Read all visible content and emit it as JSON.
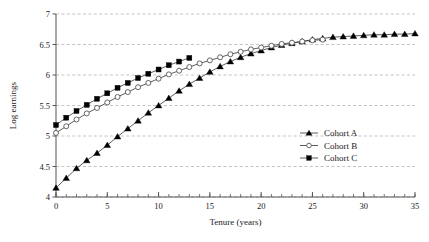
{
  "chart_data": {
    "type": "line",
    "title": "",
    "xlabel": "Tenure (years)",
    "ylabel": "Log earnings",
    "xlim": [
      0,
      35
    ],
    "ylim": [
      4,
      7
    ],
    "xticks": [
      0,
      5,
      10,
      15,
      20,
      25,
      30,
      35
    ],
    "yticks": [
      4,
      4.5,
      5,
      5.5,
      6,
      6.5,
      7
    ],
    "xtick_labels": [
      "0",
      "5",
      "10",
      "15",
      "20",
      "25",
      "30",
      "35"
    ],
    "ytick_labels": [
      "4",
      "4.5",
      "5",
      "5.5",
      "6",
      "6.5",
      "7"
    ],
    "xtick_minor_step": 1,
    "grid": true,
    "grid_axis": "y",
    "grid_style": "dashed",
    "legend_position": "center-right",
    "series": [
      {
        "name": "Cohort A",
        "marker": "filled-triangle",
        "color": "#000000",
        "x": [
          0,
          1,
          2,
          3,
          4,
          5,
          6,
          7,
          8,
          9,
          10,
          11,
          12,
          13,
          14,
          15,
          16,
          17,
          18,
          19,
          20,
          21,
          22,
          23,
          24,
          25,
          26,
          27,
          28,
          29,
          30,
          31,
          32,
          33,
          34,
          35
        ],
        "values": [
          4.15,
          4.31,
          4.47,
          4.6,
          4.72,
          4.85,
          4.99,
          5.12,
          5.25,
          5.38,
          5.5,
          5.62,
          5.74,
          5.85,
          5.95,
          6.05,
          6.14,
          6.22,
          6.29,
          6.35,
          6.4,
          6.45,
          6.49,
          6.52,
          6.55,
          6.58,
          6.6,
          6.62,
          6.63,
          6.64,
          6.65,
          6.66,
          6.66,
          6.67,
          6.67,
          6.68
        ]
      },
      {
        "name": "Cohort B",
        "marker": "open-circle",
        "color": "#000000",
        "x": [
          0,
          1,
          2,
          3,
          4,
          5,
          6,
          7,
          8,
          9,
          10,
          11,
          12,
          13,
          14,
          15,
          16,
          17,
          18,
          19,
          20,
          21,
          22,
          23,
          24,
          25,
          26
        ],
        "values": [
          5.05,
          5.16,
          5.27,
          5.37,
          5.46,
          5.55,
          5.64,
          5.72,
          5.8,
          5.87,
          5.94,
          6.01,
          6.07,
          6.13,
          6.19,
          6.24,
          6.29,
          6.34,
          6.38,
          6.42,
          6.45,
          6.48,
          6.51,
          6.53,
          6.55,
          6.57,
          6.58
        ]
      },
      {
        "name": "Cohort C",
        "marker": "filled-square",
        "color": "#000000",
        "x": [
          0,
          1,
          2,
          3,
          4,
          5,
          6,
          7,
          8,
          9,
          10,
          11,
          12,
          13
        ],
        "values": [
          5.18,
          5.3,
          5.41,
          5.51,
          5.61,
          5.7,
          5.79,
          5.87,
          5.95,
          6.02,
          6.09,
          6.16,
          6.22,
          6.28
        ]
      }
    ]
  },
  "legend": {
    "items": [
      {
        "label": "Cohort A",
        "marker": "filled-triangle"
      },
      {
        "label": "Cohort B",
        "marker": "open-circle"
      },
      {
        "label": "Cohort C",
        "marker": "filled-square"
      }
    ]
  }
}
